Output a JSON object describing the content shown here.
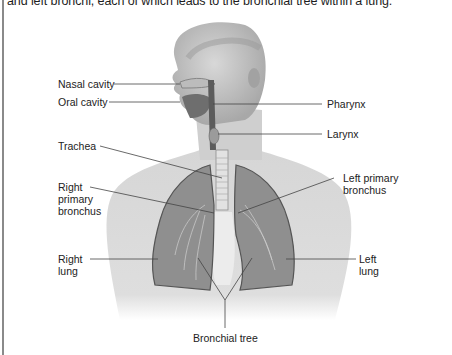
{
  "caption": {
    "text": "and left bronchi, each of which leads to the bronchial tree within a lung."
  },
  "figure": {
    "labels": {
      "nasal_cavity": "Nasal cavity",
      "oral_cavity": "Oral cavity",
      "pharynx": "Pharynx",
      "larynx": "Larynx",
      "trachea": "Trachea",
      "right_primary_bronchus": [
        "Right",
        "primary",
        "bronchus"
      ],
      "left_primary_bronchus": [
        "Left primary",
        "bronchus"
      ],
      "right_lung": [
        "Right",
        "lung"
      ],
      "left_lung": [
        "Left",
        "lung"
      ],
      "bronchial_tree": "Bronchial tree"
    }
  },
  "colors": {
    "rule": "#8a8a8a",
    "skin_light": "#e4e4e4",
    "skin_mid": "#c9c9c9",
    "skin_dark": "#9a9a9a",
    "lung": "#8f8f8f",
    "leader_line": "#444444"
  }
}
